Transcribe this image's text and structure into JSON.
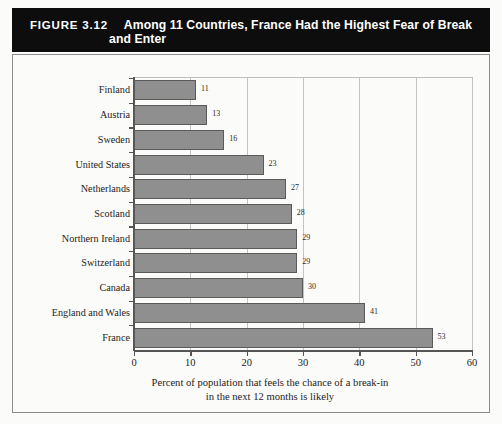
{
  "figure": {
    "number_label": "FIGURE 3.12",
    "title_line1": "Among 11 Countries, France Had the Highest Fear of Break",
    "title_line2": "and Enter",
    "banner_color": "#0d0d0d",
    "banner_text_color": "#ffffff"
  },
  "chart_data": {
    "type": "bar",
    "orientation": "horizontal",
    "title": "Among 11 Countries, France Had the Highest Fear of Break and Enter",
    "categories": [
      "Finland",
      "Austria",
      "Sweden",
      "United States",
      "Netherlands",
      "Scotland",
      "Northern Ireland",
      "Switzerland",
      "Canada",
      "England and Wales",
      "France"
    ],
    "values": [
      11,
      13,
      16,
      23,
      27,
      28,
      29,
      29,
      30,
      41,
      53
    ],
    "value_labels": [
      "11",
      "13",
      "16",
      "23",
      "27",
      "28",
      "29",
      "29",
      "30",
      "41",
      "53"
    ],
    "xlabel": "Percent of population that feels the chance of a break-in in the next 12 months is likely",
    "xlabel_line1": "Percent of population that feels the chance of a break-in",
    "xlabel_line2": "in the next 12 months is likely",
    "ylabel": "",
    "xlim": [
      0,
      60
    ],
    "xticks": [
      0,
      10,
      20,
      30,
      40,
      50,
      60
    ],
    "xtick_labels": [
      "0",
      "10",
      "20",
      "30",
      "40",
      "50",
      "60"
    ],
    "grid": true,
    "grid_axis": "x",
    "legend": false,
    "bar_color": "#8f8f8f",
    "bar_edge_color": "#5a5a5a",
    "plot_background": "#fbfbfa"
  }
}
